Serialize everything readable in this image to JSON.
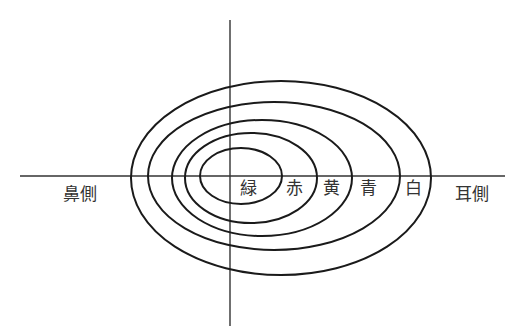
{
  "diagram": {
    "type": "visual-field-isopters",
    "colors": {
      "line": "#1a1a1a",
      "axis": "#333333",
      "text": "#333333",
      "background": "#ffffff"
    },
    "axes": {
      "horizontal": {
        "x1": 20,
        "x2": 505,
        "y": 176
      },
      "vertical": {
        "x": 230,
        "y1": 20,
        "y2": 326
      }
    },
    "side_labels": {
      "left": "鼻側",
      "right": "耳側"
    },
    "isopters": [
      {
        "name": "白",
        "cx": 281,
        "cy": 178,
        "rx": 150,
        "ry": 97
      },
      {
        "name": "青",
        "cx": 274,
        "cy": 176,
        "rx": 126,
        "ry": 74
      },
      {
        "name": "黄",
        "cx": 262,
        "cy": 178,
        "rx": 90,
        "ry": 58
      },
      {
        "name": "赤",
        "cx": 251,
        "cy": 178,
        "rx": 66,
        "ry": 45
      },
      {
        "name": "緑",
        "cx": 241,
        "cy": 176,
        "rx": 41,
        "ry": 28
      }
    ],
    "isopter_labels": [
      {
        "text": "緑",
        "x": 240,
        "y": 180
      },
      {
        "text": "赤",
        "x": 286,
        "y": 180
      },
      {
        "text": "黄",
        "x": 323,
        "y": 180
      },
      {
        "text": "青",
        "x": 360,
        "y": 180
      },
      {
        "text": "白",
        "x": 405,
        "y": 180
      }
    ],
    "side_label_positions": {
      "left": {
        "x": 63,
        "y": 186
      },
      "right": {
        "x": 455,
        "y": 186
      }
    }
  }
}
